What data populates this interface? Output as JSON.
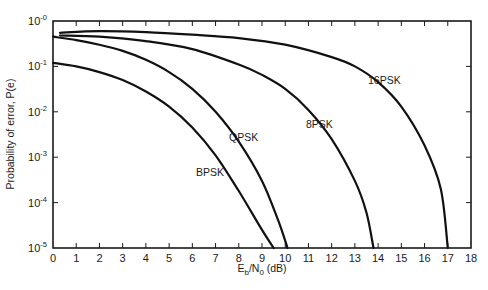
{
  "chart_data": {
    "type": "line",
    "title": "",
    "xlabel": "Eb/N0 (dB)",
    "xlabel_parts": {
      "E": "E",
      "b": "b",
      "slash": "/N",
      "zero": "0",
      "unit": " (dB)"
    },
    "ylabel": "Probability of error, P(e)",
    "xlim": [
      0,
      18
    ],
    "ylim": [
      1e-05,
      1
    ],
    "yscale": "log",
    "grid": false,
    "legend": "inline curve labels",
    "x_ticks": [
      "0",
      "1",
      "2",
      "3",
      "4",
      "5",
      "6",
      "7",
      "8",
      "9",
      "10",
      "11",
      "12",
      "13",
      "14",
      "15",
      "16",
      "17",
      "18"
    ],
    "y_ticks": [
      {
        "base": "10",
        "exp": "-0",
        "value": 1
      },
      {
        "base": "10",
        "exp": "-1",
        "value": 0.1
      },
      {
        "base": "10",
        "exp": "-2",
        "value": 0.01
      },
      {
        "base": "10",
        "exp": "-3",
        "value": 0.001
      },
      {
        "base": "10",
        "exp": "-4",
        "value": 0.0001
      },
      {
        "base": "10",
        "exp": "-5",
        "value": 1e-05
      }
    ],
    "series": [
      {
        "name": "BPSK",
        "label_pos": [
          196,
          176
        ],
        "points": [
          [
            0,
            0.12
          ],
          [
            1,
            0.1
          ],
          [
            2,
            0.075
          ],
          [
            3,
            0.05
          ],
          [
            4,
            0.028
          ],
          [
            5,
            0.013
          ],
          [
            6,
            0.0045
          ],
          [
            7,
            0.0011
          ],
          [
            8,
            0.00018
          ],
          [
            9,
            2.5e-05
          ],
          [
            9.5,
            1e-05
          ]
        ]
      },
      {
        "name": "QPSK",
        "label_pos": [
          229,
          141
        ],
        "points": [
          [
            0,
            0.45
          ],
          [
            1,
            0.38
          ],
          [
            2,
            0.3
          ],
          [
            3,
            0.22
          ],
          [
            4,
            0.14
          ],
          [
            5,
            0.075
          ],
          [
            6,
            0.032
          ],
          [
            7,
            0.01
          ],
          [
            8,
            0.0022
          ],
          [
            9,
            0.0003
          ],
          [
            9.7,
            4e-05
          ],
          [
            10.1,
            1e-05
          ]
        ]
      },
      {
        "name": "8PSK",
        "label_pos": [
          306,
          128
        ],
        "points": [
          [
            0.3,
            0.48
          ],
          [
            2,
            0.45
          ],
          [
            4,
            0.36
          ],
          [
            6,
            0.24
          ],
          [
            8,
            0.11
          ],
          [
            9,
            0.065
          ],
          [
            10,
            0.032
          ],
          [
            11,
            0.011
          ],
          [
            12,
            0.0025
          ],
          [
            13,
            0.0003
          ],
          [
            13.5,
            6e-05
          ],
          [
            13.8,
            1e-05
          ]
        ]
      },
      {
        "name": "16PSK",
        "label_pos": [
          368,
          84
        ],
        "points": [
          [
            0.3,
            0.55
          ],
          [
            2,
            0.6
          ],
          [
            4,
            0.57
          ],
          [
            6,
            0.5
          ],
          [
            8,
            0.42
          ],
          [
            10,
            0.3
          ],
          [
            12,
            0.16
          ],
          [
            13,
            0.1
          ],
          [
            14,
            0.045
          ],
          [
            15,
            0.013
          ],
          [
            16,
            0.0018
          ],
          [
            16.7,
            0.0002
          ],
          [
            17,
            1e-05
          ]
        ]
      }
    ]
  }
}
